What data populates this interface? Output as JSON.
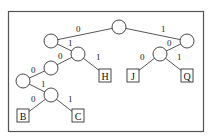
{
  "diagram": {
    "type": "binary-code-tree",
    "edge_labels": {
      "root_left": "0",
      "root_right": "1",
      "L_right": "1",
      "LR_left": "0",
      "LR_right": "1",
      "LRL_left": "0",
      "LRLL_right": "1",
      "LRLLR_left": "0",
      "LRLLR_right": "1",
      "R_left": "0",
      "RL_left": "0",
      "RL_right": "1"
    },
    "leaves": {
      "B": "B",
      "C": "C",
      "H": "H",
      "J": "J",
      "Q": "Q"
    }
  }
}
